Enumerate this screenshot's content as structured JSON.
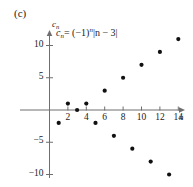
{
  "panel": {
    "label": "(c)"
  },
  "annotation": {
    "formula_text": "c_n = (-1)^n |n - 3|",
    "formula_lhs_base": "c",
    "formula_lhs_sub": "n",
    "formula_equals": "= (−1)",
    "formula_exp": "n",
    "formula_abs": "|n − 3|"
  },
  "axes": {
    "y_label": "c",
    "y_label_sub": "n",
    "x_label": "n",
    "x_ticks": [
      2,
      4,
      6,
      8,
      10,
      12,
      14
    ],
    "x_tick_labels": [
      "2",
      "4",
      "6",
      "8",
      "10",
      "12",
      "14"
    ],
    "y_ticks": [
      -10,
      -5,
      5,
      10
    ],
    "y_tick_labels": [
      "−10",
      "−5",
      "5",
      "10"
    ],
    "axis_color": "#6f6f6f",
    "point_color": "#111111"
  },
  "chart_data": {
    "type": "scatter",
    "title": "",
    "subtitle": "",
    "xlabel": "n",
    "ylabel": "c_n",
    "annotation": "c_n = (-1)^n |n - 3|",
    "panel": "(c)",
    "grid": false,
    "legend": false,
    "xlim": [
      0,
      15.2
    ],
    "ylim": [
      -11.5,
      11.8
    ],
    "x": [
      1,
      2,
      3,
      4,
      5,
      6,
      7,
      8,
      9,
      10,
      11,
      12,
      13,
      14
    ],
    "y": [
      -2,
      1,
      0,
      1,
      -2,
      3,
      -4,
      5,
      -6,
      7,
      -8,
      9,
      -10,
      11
    ],
    "points": [
      {
        "n": 1,
        "c": -2
      },
      {
        "n": 2,
        "c": 1
      },
      {
        "n": 3,
        "c": 0
      },
      {
        "n": 4,
        "c": 1
      },
      {
        "n": 5,
        "c": -2
      },
      {
        "n": 6,
        "c": 3
      },
      {
        "n": 7,
        "c": -4
      },
      {
        "n": 8,
        "c": 5
      },
      {
        "n": 9,
        "c": -6
      },
      {
        "n": 10,
        "c": 7
      },
      {
        "n": 11,
        "c": -8
      },
      {
        "n": 12,
        "c": 9
      },
      {
        "n": 13,
        "c": -10
      },
      {
        "n": 14,
        "c": 11
      }
    ],
    "x_ticks": [
      2,
      4,
      6,
      8,
      10,
      12,
      14
    ],
    "y_ticks": [
      -10,
      -5,
      5,
      10
    ],
    "marker": "circle",
    "marker_color": "#111111"
  },
  "geometry": {
    "origin_x": 49.5,
    "origin_y": 110.0,
    "x_unit": 9.2,
    "y_unit": 6.45,
    "x_axis_end": 179,
    "y_axis_top": 36,
    "y_axis_bottom": 178,
    "tick_len": 3.5
  }
}
